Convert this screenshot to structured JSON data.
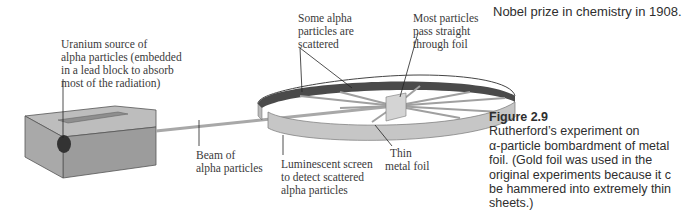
{
  "top_text": "Nobel prize in chemistry in 1908.",
  "figure": {
    "number": "Figure 2.9",
    "caption_lines": [
      "Rutherford’s experiment on",
      "α-particle bombardment of metal",
      "foil. (Gold foil was used in the",
      "original experiments because it c",
      "be hammered into extremely thin",
      "sheets.)"
    ]
  },
  "diagram": {
    "labels": {
      "source": [
        "Uranium source of",
        "alpha particles (embedded",
        "in a lead block to absorb",
        "most of the radiation)"
      ],
      "scattered": [
        "Some alpha",
        "particles are",
        "scattered"
      ],
      "most_pass": [
        "Most particles",
        "pass straight",
        "through foil"
      ],
      "beam": [
        "Beam of",
        "alpha particles"
      ],
      "screen": [
        "Luminescent screen",
        "to detect scattered",
        "alpha particles"
      ],
      "foil": [
        "Thin",
        "metal foil"
      ]
    },
    "colors": {
      "block_front": "#9a9a9a",
      "block_top": "#b8b8b8",
      "ring_inner": "#4a4a4a",
      "ring_outer": "#c4c4c4",
      "source_dot": "#333333",
      "beam": "#a8a8a8",
      "foil": "#d6d6d6"
    }
  }
}
